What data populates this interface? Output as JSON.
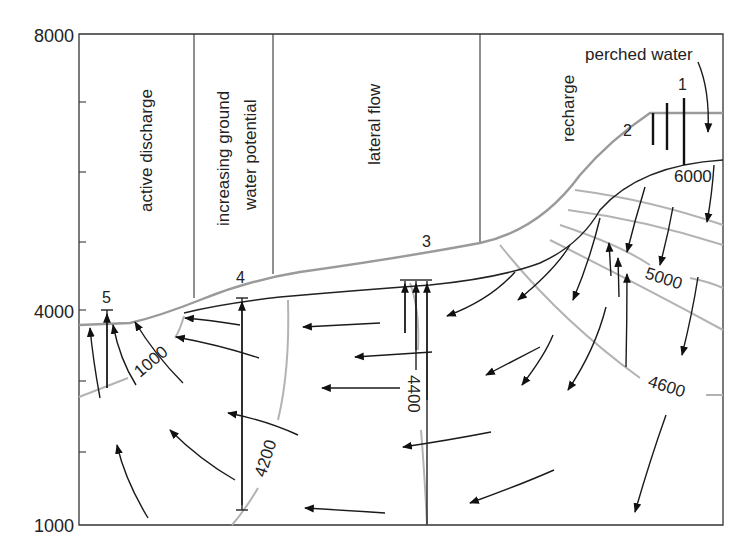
{
  "diagram": {
    "y_axis": {
      "ticks": [
        "8000",
        "4000",
        "1000"
      ]
    },
    "zones": [
      {
        "label": "active discharge"
      },
      {
        "label_line1": "increasing ground",
        "label_line2": "water potential"
      },
      {
        "label": "lateral flow"
      },
      {
        "label": "recharge"
      }
    ],
    "annotations": {
      "perched_water": "perched water"
    },
    "wells": [
      "1",
      "2",
      "3",
      "4",
      "5"
    ],
    "equipotential_labels": [
      "6000",
      "5000",
      "4600",
      "4400",
      "4200",
      "1000"
    ],
    "colors": {
      "frame": "#333333",
      "land_surface": "#9a9a9a",
      "water_table": "#222222",
      "equipotential": "#b3b3b3",
      "flow_arrow": "#1a1a1a"
    }
  }
}
